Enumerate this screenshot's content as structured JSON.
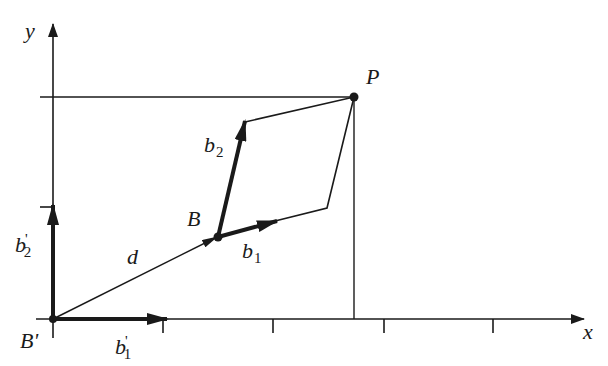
{
  "diagram": {
    "type": "vector-coordinate-frame",
    "colors": {
      "stroke": "#1a1a1a",
      "background": "#ffffff"
    },
    "axes": {
      "x_label": "x",
      "y_label": "y",
      "x_ticks_px": [
        163,
        273,
        384,
        493
      ],
      "y_ticks_px": [
        207
      ]
    },
    "points": {
      "origin": {
        "label": "B'",
        "x": 53,
        "y": 319
      },
      "B": {
        "label": "B",
        "x": 218,
        "y": 237
      },
      "P": {
        "label": "P",
        "x": 354,
        "y": 97
      }
    },
    "vectors": [
      {
        "name": "b1_prime",
        "label": "b",
        "sub": "1",
        "prime": true,
        "from": "origin",
        "to": [
          165,
          319
        ]
      },
      {
        "name": "b2_prime",
        "label": "b",
        "sub": "2",
        "prime": true,
        "from": "origin",
        "to": [
          53,
          205
        ]
      },
      {
        "name": "d",
        "label": "d",
        "from": "origin",
        "to": "B"
      },
      {
        "name": "b1",
        "label": "b",
        "sub": "1",
        "from": "B",
        "to": [
          275,
          221
        ]
      },
      {
        "name": "b2",
        "label": "b",
        "sub": "2",
        "from": "B",
        "to": [
          245,
          122
        ]
      }
    ],
    "parallelogram": [
      [
        218,
        237
      ],
      [
        327,
        208
      ],
      [
        354,
        97
      ],
      [
        245,
        122
      ]
    ],
    "labels": {
      "y": "y",
      "x": "x",
      "P": "P",
      "B": "B",
      "B_prime": "B'",
      "d": "d",
      "b": "b",
      "sub1": "1",
      "sub2": "2",
      "prime": "'"
    }
  }
}
